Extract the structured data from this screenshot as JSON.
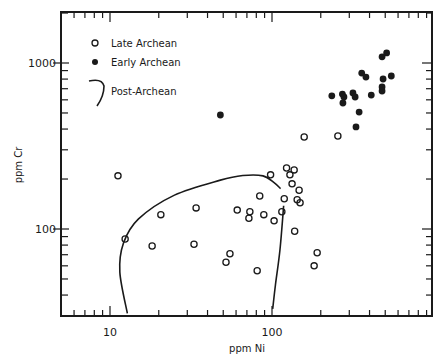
{
  "chart_data": {
    "type": "scatter",
    "title": "",
    "xlabel": "ppm Ni",
    "ylabel": "ppm Cr",
    "xscale": "log",
    "yscale": "log",
    "xlim": [
      5,
      1000
    ],
    "ylim": [
      30,
      2000
    ],
    "x_tick_labels": [
      "10",
      "100"
    ],
    "y_tick_labels": [
      "100",
      "1000"
    ],
    "grid": false,
    "legend": {
      "position": "upper-left",
      "entries": [
        {
          "label": "Late Archean",
          "marker": "open-circle"
        },
        {
          "label": "Early Archean",
          "marker": "filled-circle"
        },
        {
          "label": "Post-Archean",
          "marker": "curve"
        }
      ]
    },
    "series": [
      {
        "name": "Late Archean",
        "marker": "open-circle",
        "points": [
          [
            11.2,
            209
          ],
          [
            12.4,
            87
          ],
          [
            20.6,
            122
          ],
          [
            18.2,
            79
          ],
          [
            34,
            134
          ],
          [
            33,
            81
          ],
          [
            52,
            63
          ],
          [
            55,
            71
          ],
          [
            81,
            56
          ],
          [
            61,
            130
          ],
          [
            73,
            127
          ],
          [
            72,
            116
          ],
          [
            89,
            122
          ],
          [
            103,
            112
          ],
          [
            84,
            158
          ],
          [
            98,
            212
          ],
          [
            115,
            127
          ],
          [
            123,
            233
          ],
          [
            129,
            212
          ],
          [
            133,
            187
          ],
          [
            119,
            152
          ],
          [
            137,
            227
          ],
          [
            147,
            171
          ],
          [
            143,
            150
          ],
          [
            149,
            144
          ],
          [
            138,
            97
          ],
          [
            190,
            72
          ],
          [
            182,
            60
          ],
          [
            158,
            358
          ],
          [
            255,
            363
          ]
        ]
      },
      {
        "name": "Early Archean",
        "marker": "filled-circle",
        "points": [
          [
            48,
            486
          ],
          [
            234,
            634
          ],
          [
            272,
            650
          ],
          [
            278,
            624
          ],
          [
            274,
            574
          ],
          [
            316,
            660
          ],
          [
            326,
            624
          ],
          [
            345,
            506
          ],
          [
            330,
            412
          ],
          [
            358,
            870
          ],
          [
            380,
            823
          ],
          [
            410,
            641
          ],
          [
            478,
            1090
          ],
          [
            510,
            1150
          ],
          [
            485,
            801
          ],
          [
            545,
            835
          ],
          [
            478,
            717
          ],
          [
            478,
            678
          ]
        ]
      },
      {
        "name": "Post-Archean",
        "type": "envelope-curve",
        "outline": [
          [
            12.8,
            31
          ],
          [
            11.5,
            55
          ],
          [
            12.1,
            82
          ],
          [
            15,
            115
          ],
          [
            25,
            160
          ],
          [
            48,
            197
          ],
          [
            66,
            210
          ],
          [
            88,
            209
          ],
          [
            103,
            190
          ],
          [
            113,
            175
          ]
        ],
        "outline_right": [
          [
            118,
            138
          ],
          [
            112,
            75
          ],
          [
            105,
            46
          ],
          [
            101,
            33
          ]
        ]
      }
    ]
  },
  "labels": {
    "x_axis": "ppm Ni",
    "y_axis": "ppm Cr",
    "x_tick_10": "10",
    "x_tick_100": "100",
    "y_tick_100": "100",
    "y_tick_1000": "1000",
    "legend_late": "Late Archean",
    "legend_early": "Early Archean",
    "legend_post": "Post-Archean"
  },
  "colors": {
    "ink": "#1a1a1a",
    "background": "#ffffff"
  }
}
